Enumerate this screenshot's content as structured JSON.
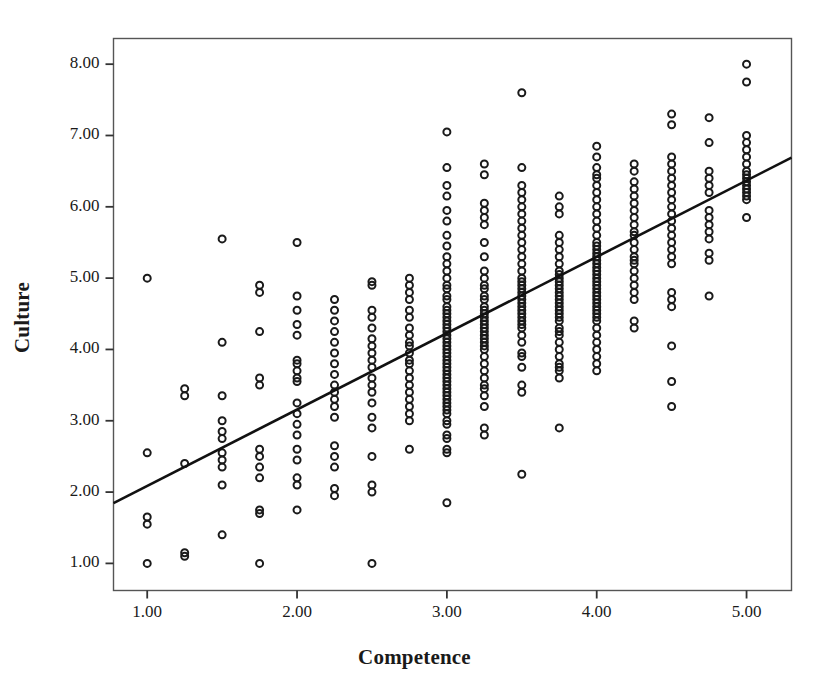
{
  "chart_data": {
    "type": "scatter",
    "title": "",
    "xlabel": "Competence",
    "ylabel": "Culture",
    "xlim": [
      0.775,
      5.3
    ],
    "ylim": [
      0.62,
      8.36
    ],
    "xticks": [
      1,
      2,
      3,
      4,
      5
    ],
    "xtick_labels": [
      "1.00",
      "2.00",
      "3.00",
      "4.00",
      "5.00"
    ],
    "yticks": [
      1,
      2,
      3,
      4,
      5,
      6,
      7,
      8
    ],
    "ytick_labels": [
      "1.00",
      "2.00",
      "3.00",
      "4.00",
      "5.00",
      "6.00",
      "7.00",
      "8.00"
    ],
    "grid": false,
    "legend": false,
    "marker": "open-circle",
    "marker_color": "#1a1a1a",
    "marker_size": 7,
    "frame_color": "#555555",
    "fit_line": {
      "label": "linear fit",
      "color": "#111111",
      "width": 2.6,
      "x_start": 0.775,
      "y_start": 1.845,
      "x_end": 5.3,
      "y_end": 6.69,
      "slope": 1.071,
      "intercept": 1.015
    },
    "points": [
      [
        1.0,
        5.0
      ],
      [
        1.0,
        2.55
      ],
      [
        1.0,
        1.65
      ],
      [
        1.0,
        1.55
      ],
      [
        1.0,
        1.0
      ],
      [
        1.25,
        3.45
      ],
      [
        1.25,
        3.35
      ],
      [
        1.25,
        2.4
      ],
      [
        1.25,
        1.15
      ],
      [
        1.25,
        1.1
      ],
      [
        1.5,
        5.55
      ],
      [
        1.5,
        4.1
      ],
      [
        1.5,
        3.35
      ],
      [
        1.5,
        3.0
      ],
      [
        1.5,
        2.85
      ],
      [
        1.5,
        2.75
      ],
      [
        1.5,
        2.55
      ],
      [
        1.5,
        2.45
      ],
      [
        1.5,
        2.35
      ],
      [
        1.5,
        2.1
      ],
      [
        1.5,
        1.4
      ],
      [
        1.75,
        4.9
      ],
      [
        1.75,
        4.8
      ],
      [
        1.75,
        4.25
      ],
      [
        1.75,
        3.6
      ],
      [
        1.75,
        3.5
      ],
      [
        1.75,
        2.6
      ],
      [
        1.75,
        2.5
      ],
      [
        1.75,
        2.35
      ],
      [
        1.75,
        2.2
      ],
      [
        1.75,
        1.75
      ],
      [
        1.75,
        1.7
      ],
      [
        1.75,
        1.0
      ],
      [
        2.0,
        5.5
      ],
      [
        2.0,
        4.75
      ],
      [
        2.0,
        4.55
      ],
      [
        2.0,
        4.35
      ],
      [
        2.0,
        4.2
      ],
      [
        2.0,
        3.85
      ],
      [
        2.0,
        3.8
      ],
      [
        2.0,
        3.7
      ],
      [
        2.0,
        3.6
      ],
      [
        2.0,
        3.55
      ],
      [
        2.0,
        3.25
      ],
      [
        2.0,
        3.1
      ],
      [
        2.0,
        2.95
      ],
      [
        2.0,
        2.8
      ],
      [
        2.0,
        2.6
      ],
      [
        2.0,
        2.45
      ],
      [
        2.0,
        2.2
      ],
      [
        2.0,
        2.1
      ],
      [
        2.0,
        1.75
      ],
      [
        2.25,
        4.7
      ],
      [
        2.25,
        4.55
      ],
      [
        2.25,
        4.4
      ],
      [
        2.25,
        4.25
      ],
      [
        2.25,
        4.1
      ],
      [
        2.25,
        3.95
      ],
      [
        2.25,
        3.8
      ],
      [
        2.25,
        3.65
      ],
      [
        2.25,
        3.5
      ],
      [
        2.25,
        3.4
      ],
      [
        2.25,
        3.3
      ],
      [
        2.25,
        3.2
      ],
      [
        2.25,
        3.05
      ],
      [
        2.25,
        2.65
      ],
      [
        2.25,
        2.5
      ],
      [
        2.25,
        2.35
      ],
      [
        2.25,
        2.05
      ],
      [
        2.25,
        1.95
      ],
      [
        2.5,
        4.95
      ],
      [
        2.5,
        4.9
      ],
      [
        2.5,
        4.55
      ],
      [
        2.5,
        4.45
      ],
      [
        2.5,
        4.3
      ],
      [
        2.5,
        4.15
      ],
      [
        2.5,
        4.05
      ],
      [
        2.5,
        3.95
      ],
      [
        2.5,
        3.85
      ],
      [
        2.5,
        3.75
      ],
      [
        2.5,
        3.6
      ],
      [
        2.5,
        3.5
      ],
      [
        2.5,
        3.4
      ],
      [
        2.5,
        3.25
      ],
      [
        2.5,
        3.05
      ],
      [
        2.5,
        2.9
      ],
      [
        2.5,
        2.5
      ],
      [
        2.5,
        2.1
      ],
      [
        2.5,
        2.0
      ],
      [
        2.5,
        1.0
      ],
      [
        2.75,
        5.0
      ],
      [
        2.75,
        4.9
      ],
      [
        2.75,
        4.8
      ],
      [
        2.75,
        4.7
      ],
      [
        2.75,
        4.55
      ],
      [
        2.75,
        4.45
      ],
      [
        2.75,
        4.3
      ],
      [
        2.75,
        4.2
      ],
      [
        2.75,
        4.1
      ],
      [
        2.75,
        4.05
      ],
      [
        2.75,
        3.95
      ],
      [
        2.75,
        3.85
      ],
      [
        2.75,
        3.8
      ],
      [
        2.75,
        3.7
      ],
      [
        2.75,
        3.6
      ],
      [
        2.75,
        3.5
      ],
      [
        2.75,
        3.4
      ],
      [
        2.75,
        3.3
      ],
      [
        2.75,
        3.2
      ],
      [
        2.75,
        3.1
      ],
      [
        2.75,
        3.0
      ],
      [
        2.75,
        2.6
      ],
      [
        3.0,
        7.05
      ],
      [
        3.0,
        6.55
      ],
      [
        3.0,
        6.3
      ],
      [
        3.0,
        6.15
      ],
      [
        3.0,
        5.95
      ],
      [
        3.0,
        5.8
      ],
      [
        3.0,
        5.6
      ],
      [
        3.0,
        5.45
      ],
      [
        3.0,
        5.3
      ],
      [
        3.0,
        5.2
      ],
      [
        3.0,
        5.1
      ],
      [
        3.0,
        5.0
      ],
      [
        3.0,
        4.9
      ],
      [
        3.0,
        4.85
      ],
      [
        3.0,
        4.75
      ],
      [
        3.0,
        4.7
      ],
      [
        3.0,
        4.6
      ],
      [
        3.0,
        4.55
      ],
      [
        3.0,
        4.5
      ],
      [
        3.0,
        4.45
      ],
      [
        3.0,
        4.4
      ],
      [
        3.0,
        4.35
      ],
      [
        3.0,
        4.3
      ],
      [
        3.0,
        4.25
      ],
      [
        3.0,
        4.2
      ],
      [
        3.0,
        4.15
      ],
      [
        3.0,
        4.1
      ],
      [
        3.0,
        4.05
      ],
      [
        3.0,
        4.0
      ],
      [
        3.0,
        3.95
      ],
      [
        3.0,
        3.9
      ],
      [
        3.0,
        3.85
      ],
      [
        3.0,
        3.8
      ],
      [
        3.0,
        3.75
      ],
      [
        3.0,
        3.7
      ],
      [
        3.0,
        3.65
      ],
      [
        3.0,
        3.6
      ],
      [
        3.0,
        3.55
      ],
      [
        3.0,
        3.5
      ],
      [
        3.0,
        3.45
      ],
      [
        3.0,
        3.4
      ],
      [
        3.0,
        3.35
      ],
      [
        3.0,
        3.3
      ],
      [
        3.0,
        3.25
      ],
      [
        3.0,
        3.2
      ],
      [
        3.0,
        3.15
      ],
      [
        3.0,
        3.1
      ],
      [
        3.0,
        3.0
      ],
      [
        3.0,
        2.95
      ],
      [
        3.0,
        2.8
      ],
      [
        3.0,
        2.75
      ],
      [
        3.0,
        2.6
      ],
      [
        3.0,
        2.55
      ],
      [
        3.0,
        1.85
      ],
      [
        3.25,
        6.6
      ],
      [
        3.25,
        6.45
      ],
      [
        3.25,
        6.05
      ],
      [
        3.25,
        5.95
      ],
      [
        3.25,
        5.85
      ],
      [
        3.25,
        5.75
      ],
      [
        3.25,
        5.5
      ],
      [
        3.25,
        5.3
      ],
      [
        3.25,
        5.1
      ],
      [
        3.25,
        5.0
      ],
      [
        3.25,
        4.9
      ],
      [
        3.25,
        4.85
      ],
      [
        3.25,
        4.75
      ],
      [
        3.25,
        4.7
      ],
      [
        3.25,
        4.6
      ],
      [
        3.25,
        4.55
      ],
      [
        3.25,
        4.5
      ],
      [
        3.25,
        4.45
      ],
      [
        3.25,
        4.4
      ],
      [
        3.25,
        4.35
      ],
      [
        3.25,
        4.3
      ],
      [
        3.25,
        4.25
      ],
      [
        3.25,
        4.2
      ],
      [
        3.25,
        4.15
      ],
      [
        3.25,
        4.1
      ],
      [
        3.25,
        4.05
      ],
      [
        3.25,
        4.0
      ],
      [
        3.25,
        3.9
      ],
      [
        3.25,
        3.8
      ],
      [
        3.25,
        3.7
      ],
      [
        3.25,
        3.6
      ],
      [
        3.25,
        3.5
      ],
      [
        3.25,
        3.45
      ],
      [
        3.25,
        3.35
      ],
      [
        3.25,
        3.2
      ],
      [
        3.25,
        2.9
      ],
      [
        3.25,
        2.8
      ],
      [
        3.5,
        7.6
      ],
      [
        3.5,
        6.55
      ],
      [
        3.5,
        6.3
      ],
      [
        3.5,
        6.2
      ],
      [
        3.5,
        6.1
      ],
      [
        3.5,
        6.0
      ],
      [
        3.5,
        5.9
      ],
      [
        3.5,
        5.8
      ],
      [
        3.5,
        5.7
      ],
      [
        3.5,
        5.6
      ],
      [
        3.5,
        5.5
      ],
      [
        3.5,
        5.4
      ],
      [
        3.5,
        5.3
      ],
      [
        3.5,
        5.2
      ],
      [
        3.5,
        5.1
      ],
      [
        3.5,
        5.0
      ],
      [
        3.5,
        4.95
      ],
      [
        3.5,
        4.9
      ],
      [
        3.5,
        4.85
      ],
      [
        3.5,
        4.8
      ],
      [
        3.5,
        4.75
      ],
      [
        3.5,
        4.7
      ],
      [
        3.5,
        4.65
      ],
      [
        3.5,
        4.6
      ],
      [
        3.5,
        4.55
      ],
      [
        3.5,
        4.5
      ],
      [
        3.5,
        4.45
      ],
      [
        3.5,
        4.4
      ],
      [
        3.5,
        4.35
      ],
      [
        3.5,
        4.3
      ],
      [
        3.5,
        4.2
      ],
      [
        3.5,
        4.1
      ],
      [
        3.5,
        3.95
      ],
      [
        3.5,
        3.9
      ],
      [
        3.5,
        3.75
      ],
      [
        3.5,
        3.5
      ],
      [
        3.5,
        3.4
      ],
      [
        3.5,
        2.25
      ],
      [
        3.75,
        6.15
      ],
      [
        3.75,
        6.0
      ],
      [
        3.75,
        5.9
      ],
      [
        3.75,
        5.6
      ],
      [
        3.75,
        5.5
      ],
      [
        3.75,
        5.4
      ],
      [
        3.75,
        5.3
      ],
      [
        3.75,
        5.2
      ],
      [
        3.75,
        5.1
      ],
      [
        3.75,
        5.05
      ],
      [
        3.75,
        5.0
      ],
      [
        3.75,
        4.95
      ],
      [
        3.75,
        4.9
      ],
      [
        3.75,
        4.85
      ],
      [
        3.75,
        4.8
      ],
      [
        3.75,
        4.75
      ],
      [
        3.75,
        4.7
      ],
      [
        3.75,
        4.65
      ],
      [
        3.75,
        4.6
      ],
      [
        3.75,
        4.55
      ],
      [
        3.75,
        4.5
      ],
      [
        3.75,
        4.45
      ],
      [
        3.75,
        4.4
      ],
      [
        3.75,
        4.3
      ],
      [
        3.75,
        4.25
      ],
      [
        3.75,
        4.2
      ],
      [
        3.75,
        4.1
      ],
      [
        3.75,
        4.0
      ],
      [
        3.75,
        3.9
      ],
      [
        3.75,
        3.8
      ],
      [
        3.75,
        3.75
      ],
      [
        3.75,
        3.7
      ],
      [
        3.75,
        3.6
      ],
      [
        3.75,
        2.9
      ],
      [
        4.0,
        6.85
      ],
      [
        4.0,
        6.7
      ],
      [
        4.0,
        6.55
      ],
      [
        4.0,
        6.45
      ],
      [
        4.0,
        6.4
      ],
      [
        4.0,
        6.3
      ],
      [
        4.0,
        6.2
      ],
      [
        4.0,
        6.1
      ],
      [
        4.0,
        6.0
      ],
      [
        4.0,
        5.9
      ],
      [
        4.0,
        5.8
      ],
      [
        4.0,
        5.7
      ],
      [
        4.0,
        5.6
      ],
      [
        4.0,
        5.5
      ],
      [
        4.0,
        5.45
      ],
      [
        4.0,
        5.4
      ],
      [
        4.0,
        5.35
      ],
      [
        4.0,
        5.3
      ],
      [
        4.0,
        5.25
      ],
      [
        4.0,
        5.2
      ],
      [
        4.0,
        5.15
      ],
      [
        4.0,
        5.1
      ],
      [
        4.0,
        5.05
      ],
      [
        4.0,
        5.0
      ],
      [
        4.0,
        4.95
      ],
      [
        4.0,
        4.9
      ],
      [
        4.0,
        4.85
      ],
      [
        4.0,
        4.8
      ],
      [
        4.0,
        4.75
      ],
      [
        4.0,
        4.7
      ],
      [
        4.0,
        4.65
      ],
      [
        4.0,
        4.6
      ],
      [
        4.0,
        4.55
      ],
      [
        4.0,
        4.5
      ],
      [
        4.0,
        4.45
      ],
      [
        4.0,
        4.4
      ],
      [
        4.0,
        4.3
      ],
      [
        4.0,
        4.2
      ],
      [
        4.0,
        4.1
      ],
      [
        4.0,
        4.0
      ],
      [
        4.0,
        3.9
      ],
      [
        4.0,
        3.8
      ],
      [
        4.0,
        3.7
      ],
      [
        4.25,
        6.6
      ],
      [
        4.25,
        6.5
      ],
      [
        4.25,
        6.35
      ],
      [
        4.25,
        6.25
      ],
      [
        4.25,
        6.15
      ],
      [
        4.25,
        6.05
      ],
      [
        4.25,
        5.95
      ],
      [
        4.25,
        5.85
      ],
      [
        4.25,
        5.75
      ],
      [
        4.25,
        5.65
      ],
      [
        4.25,
        5.6
      ],
      [
        4.25,
        5.5
      ],
      [
        4.25,
        5.4
      ],
      [
        4.25,
        5.3
      ],
      [
        4.25,
        5.25
      ],
      [
        4.25,
        5.2
      ],
      [
        4.25,
        5.1
      ],
      [
        4.25,
        5.0
      ],
      [
        4.25,
        4.9
      ],
      [
        4.25,
        4.8
      ],
      [
        4.25,
        4.7
      ],
      [
        4.25,
        4.4
      ],
      [
        4.25,
        4.3
      ],
      [
        4.5,
        7.3
      ],
      [
        4.5,
        7.15
      ],
      [
        4.5,
        6.7
      ],
      [
        4.5,
        6.6
      ],
      [
        4.5,
        6.5
      ],
      [
        4.5,
        6.4
      ],
      [
        4.5,
        6.3
      ],
      [
        4.5,
        6.2
      ],
      [
        4.5,
        6.1
      ],
      [
        4.5,
        6.0
      ],
      [
        4.5,
        5.9
      ],
      [
        4.5,
        5.8
      ],
      [
        4.5,
        5.7
      ],
      [
        4.5,
        5.6
      ],
      [
        4.5,
        5.5
      ],
      [
        4.5,
        5.4
      ],
      [
        4.5,
        5.3
      ],
      [
        4.5,
        5.2
      ],
      [
        4.5,
        4.8
      ],
      [
        4.5,
        4.7
      ],
      [
        4.5,
        4.6
      ],
      [
        4.5,
        4.05
      ],
      [
        4.5,
        3.55
      ],
      [
        4.5,
        3.2
      ],
      [
        4.75,
        7.25
      ],
      [
        4.75,
        6.9
      ],
      [
        4.75,
        6.5
      ],
      [
        4.75,
        6.4
      ],
      [
        4.75,
        6.3
      ],
      [
        4.75,
        6.2
      ],
      [
        4.75,
        5.95
      ],
      [
        4.75,
        5.85
      ],
      [
        4.75,
        5.75
      ],
      [
        4.75,
        5.65
      ],
      [
        4.75,
        5.55
      ],
      [
        4.75,
        5.35
      ],
      [
        4.75,
        5.25
      ],
      [
        4.75,
        4.75
      ],
      [
        5.0,
        8.0
      ],
      [
        5.0,
        7.75
      ],
      [
        5.0,
        7.0
      ],
      [
        5.0,
        6.9
      ],
      [
        5.0,
        6.8
      ],
      [
        5.0,
        6.7
      ],
      [
        5.0,
        6.6
      ],
      [
        5.0,
        6.5
      ],
      [
        5.0,
        6.45
      ],
      [
        5.0,
        6.4
      ],
      [
        5.0,
        6.35
      ],
      [
        5.0,
        6.3
      ],
      [
        5.0,
        6.25
      ],
      [
        5.0,
        6.2
      ],
      [
        5.0,
        6.15
      ],
      [
        5.0,
        6.1
      ],
      [
        5.0,
        5.85
      ]
    ]
  }
}
